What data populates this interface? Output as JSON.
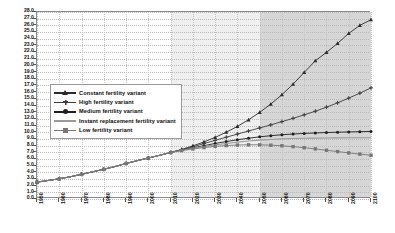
{
  "chart_data": {
    "type": "line",
    "title": "",
    "xlabel": "",
    "ylabel": "",
    "xlim": [
      1950,
      2100
    ],
    "ylim": [
      0.0,
      28.0
    ],
    "grid": true,
    "legend_position": "upper-left-inside",
    "y_ticks": [
      "28.0",
      "27.0",
      "26.0",
      "25.0",
      "24.0",
      "23.0",
      "22.0",
      "21.0",
      "20.0",
      "19.0",
      "18.0",
      "17.0",
      "16.0",
      "15.0",
      "14.0",
      "13.0",
      "12.0",
      "11.0",
      "10.0",
      "9.0",
      "8.0",
      "7.0",
      "6.0",
      "5.0",
      "4.0",
      "3.0",
      "2.0",
      "1.0",
      "0.0"
    ],
    "x_ticks": [
      "1950",
      "1960",
      "1970",
      "1980",
      "1990",
      "2000",
      "2010",
      "2020",
      "2030",
      "2040",
      "2050",
      "2060",
      "2070",
      "2080",
      "2090",
      "2100"
    ],
    "x": [
      1950,
      1955,
      1960,
      1965,
      1970,
      1975,
      1980,
      1985,
      1990,
      1995,
      2000,
      2005,
      2010,
      2015,
      2020,
      2025,
      2030,
      2035,
      2040,
      2045,
      2050,
      2055,
      2060,
      2065,
      2070,
      2075,
      2080,
      2085,
      2090,
      2095,
      2100
    ],
    "series": [
      {
        "name": "Constant fertility variant",
        "marker": "triangle",
        "color": "#2b2b2b",
        "values": [
          2.53,
          2.77,
          3.03,
          3.33,
          3.7,
          4.07,
          4.45,
          4.86,
          5.32,
          5.74,
          6.14,
          6.54,
          6.96,
          7.43,
          7.95,
          8.55,
          9.23,
          10.0,
          10.87,
          11.86,
          12.97,
          14.22,
          15.62,
          17.19,
          18.95,
          20.7,
          21.95,
          23.3,
          24.8,
          26.0,
          26.85
        ]
      },
      {
        "name": "High fertility variant",
        "marker": "plus",
        "color": "#3d3d3d",
        "values": [
          2.53,
          2.77,
          3.03,
          3.33,
          3.7,
          4.07,
          4.45,
          4.86,
          5.32,
          5.74,
          6.14,
          6.54,
          6.96,
          7.38,
          7.82,
          8.3,
          8.78,
          9.25,
          9.72,
          10.18,
          10.64,
          11.1,
          11.58,
          12.08,
          12.6,
          13.15,
          13.75,
          14.4,
          15.1,
          15.85,
          16.64
        ]
      },
      {
        "name": "Medium fertility variant",
        "marker": "circle",
        "color": "#1f1f1f",
        "values": [
          2.53,
          2.77,
          3.03,
          3.33,
          3.7,
          4.07,
          4.45,
          4.86,
          5.32,
          5.74,
          6.14,
          6.54,
          6.96,
          7.32,
          7.66,
          7.98,
          8.32,
          8.6,
          8.87,
          9.1,
          9.31,
          9.48,
          9.62,
          9.73,
          9.82,
          9.89,
          9.95,
          10.0,
          10.04,
          10.08,
          10.12
        ]
      },
      {
        "name": "Instant replacement fertility variant",
        "marker": "none",
        "color": "#9a9a9a",
        "values": [
          2.53,
          2.77,
          3.03,
          3.33,
          3.7,
          4.07,
          4.45,
          4.86,
          5.32,
          5.74,
          6.14,
          6.54,
          6.96,
          7.28,
          7.58,
          7.86,
          8.1,
          8.32,
          8.52,
          8.68,
          8.82,
          8.92,
          9.0,
          9.06,
          9.1,
          9.12,
          9.14,
          9.15,
          9.16,
          9.17,
          9.18
        ]
      },
      {
        "name": "Low fertility variant",
        "marker": "square",
        "color": "#777777",
        "values": [
          2.53,
          2.77,
          3.03,
          3.33,
          3.7,
          4.07,
          4.45,
          4.86,
          5.32,
          5.74,
          6.14,
          6.54,
          6.96,
          7.25,
          7.5,
          7.7,
          7.88,
          8.0,
          8.08,
          8.12,
          8.11,
          8.06,
          7.97,
          7.84,
          7.68,
          7.5,
          7.3,
          7.1,
          6.9,
          6.72,
          6.55
        ]
      }
    ],
    "shaded_bands": [
      {
        "name": "projection-band-light",
        "from": 2010,
        "to": 2050,
        "color": "#efefef"
      },
      {
        "name": "projection-band-dark",
        "from": 2050,
        "to": 2100,
        "color": "#d6d6d6"
      }
    ]
  },
  "legend": {
    "items": [
      {
        "label": "Constant fertility variant"
      },
      {
        "label": "High fertility variant"
      },
      {
        "label": "Medium fertility variant"
      },
      {
        "label": "Instant replacement fertility variant"
      },
      {
        "label": "Low fertility variant"
      }
    ]
  }
}
